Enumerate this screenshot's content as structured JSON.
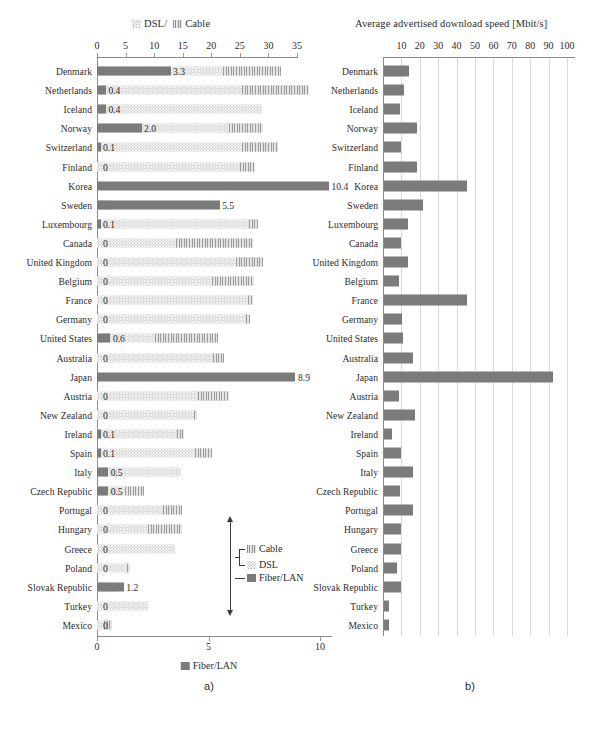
{
  "figure": {
    "panel_a": {
      "title": "DSL/   Cable",
      "title_parts": [
        "DSL/",
        "Cable"
      ],
      "caption": "a)",
      "top_axis": {
        "ticks": [
          0,
          5,
          10,
          15,
          20,
          25,
          30,
          35
        ],
        "min": 0,
        "max": 35
      },
      "bottom_axis": {
        "ticks": [
          0,
          5,
          10
        ],
        "min": 0,
        "max": 12.3,
        "legend": "Fiber/LAN"
      },
      "legend": {
        "cable": "Cable",
        "dsl": "DSL",
        "fiber": "Fiber/LAN"
      }
    },
    "panel_b": {
      "title": "Average advertised download speed [Mbit/s]",
      "caption": "b)",
      "axis": {
        "ticks": [
          10,
          20,
          30,
          40,
          50,
          60,
          70,
          80,
          90,
          100
        ],
        "min": 0,
        "max": 105
      }
    }
  },
  "chart_data": [
    {
      "type": "bar",
      "orientation": "horizontal",
      "stacked": true,
      "id": "panel-a",
      "title": "DSL/ Cable",
      "xlabel": "",
      "ylabel": "",
      "xlim": [
        0,
        35
      ],
      "secondary_xlim": [
        0,
        12.3
      ],
      "secondary_xlabel": "Fiber/LAN",
      "grid": false,
      "legend": [
        "Cable",
        "DSL",
        "Fiber/LAN"
      ],
      "categories": [
        "Denmark",
        "Netherlands",
        "Iceland",
        "Norway",
        "Switzerland",
        "Finland",
        "Korea",
        "Sweden",
        "Luxembourg",
        "Canada",
        "United Kingdom",
        "Belgium",
        "France",
        "Germany",
        "United States",
        "Australia",
        "Japan",
        "Austria",
        "New Zealand",
        "Ireland",
        "Spain",
        "Italy",
        "Czech Republic",
        "Portugal",
        "Hungary",
        "Greece",
        "Poland",
        "Slovak Republic",
        "Turkey",
        "Mexico"
      ],
      "series": [
        {
          "name": "Fiber/LAN",
          "unit": "subscribers per 100 inhabitants",
          "values": [
            3.3,
            0.4,
            0.4,
            2.0,
            0.1,
            0.0,
            10.4,
            5.5,
            0.1,
            0.0,
            0.0,
            0.0,
            0.0,
            0.0,
            0.6,
            0.0,
            8.9,
            0.0,
            0.0,
            0.1,
            0.1,
            0.5,
            0.5,
            0.0,
            0.0,
            0.0,
            0.0,
            1.2,
            0.0,
            0.0
          ],
          "labels": [
            "3.3",
            "0.4",
            "0.4",
            "2.0",
            "0.1",
            "0",
            "10.4",
            "5.5",
            "0.1",
            "0",
            "0",
            "0",
            "0",
            "0",
            "0.6",
            "0",
            "8.9",
            "0",
            "0",
            "0.1",
            "0.1",
            "0.5",
            "0.5",
            "0",
            "0",
            "0",
            "0",
            "1.2",
            "0",
            "0"
          ]
        },
        {
          "name": "DSL",
          "values": [
            22.0,
            25.3,
            28.8,
            23.1,
            25.4,
            25.0,
            0.0,
            0.0,
            26.6,
            13.9,
            24.3,
            20.1,
            26.4,
            26.1,
            10.1,
            20.3,
            0.0,
            17.7,
            16.9,
            14.0,
            17.1,
            14.6,
            4.9,
            11.5,
            9.0,
            13.6,
            5.2,
            3.3,
            8.9,
            1.2
          ]
        },
        {
          "name": "Cable",
          "values": [
            10.2,
            11.8,
            0.0,
            6.0,
            6.2,
            2.6,
            0.0,
            2.4,
            1.5,
            13.4,
            4.8,
            7.4,
            0.9,
            0.6,
            11.0,
            1.9,
            0.0,
            5.4,
            0.6,
            1.3,
            3.0,
            0.0,
            3.4,
            3.4,
            5.8,
            0.0,
            0.5,
            0.0,
            0.0,
            1.4
          ]
        }
      ]
    },
    {
      "type": "bar",
      "orientation": "horizontal",
      "id": "panel-b",
      "title": "Average advertised download speed [Mbit/s]",
      "xlabel": "Mbit/s",
      "ylabel": "",
      "xlim": [
        0,
        105
      ],
      "grid": true,
      "categories": [
        "Denmark",
        "Netherlands",
        "Iceland",
        "Norway",
        "Switzerland",
        "Finland",
        "Korea",
        "Sweden",
        "Luxembourg",
        "Canada",
        "United Kingdom",
        "Belgium",
        "France",
        "Germany",
        "United States",
        "Australia",
        "Japan",
        "Austria",
        "New Zealand",
        "Ireland",
        "Spain",
        "Italy",
        "Czech Republic",
        "Portugal",
        "Hungary",
        "Greece",
        "Poland",
        "Slovak Republic",
        "Turkey",
        "Mexico"
      ],
      "values": [
        13.5,
        11.0,
        8.5,
        18.0,
        9.0,
        18.0,
        45.0,
        21.0,
        13.0,
        9.5,
        13.0,
        8.0,
        45.0,
        10.0,
        10.5,
        15.5,
        92.0,
        8.0,
        17.0,
        4.5,
        9.5,
        15.5,
        8.5,
        15.5,
        9.0,
        9.5,
        7.0,
        9.5,
        2.5,
        2.5
      ]
    }
  ]
}
